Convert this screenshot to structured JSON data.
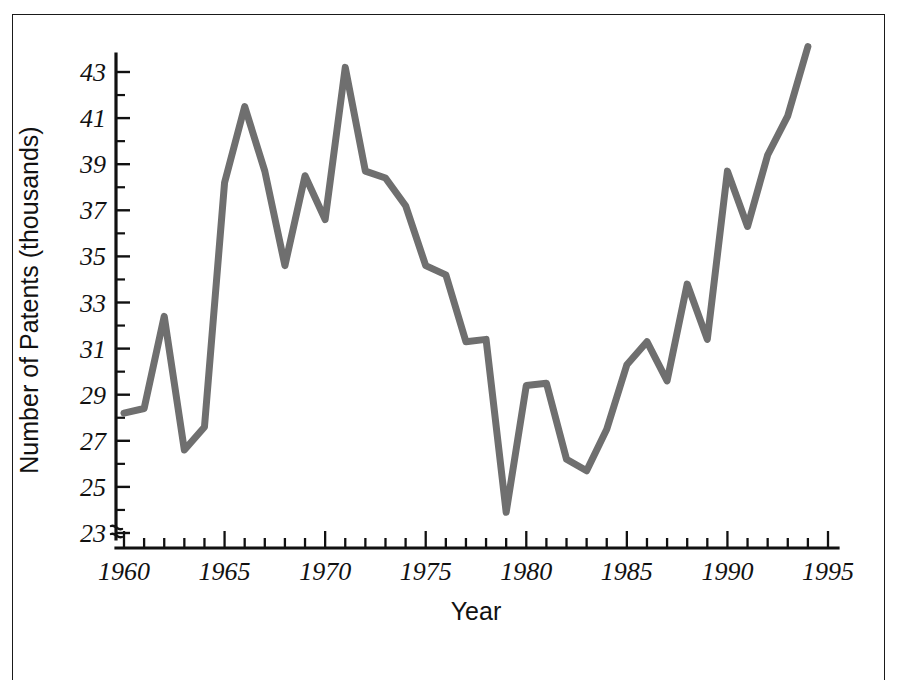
{
  "figure": {
    "line_color": "#6f6f6f",
    "axis_color": "#111111",
    "background": "#ffffff"
  },
  "axes": {
    "y_axis_label": "Number of Patents (thousands)",
    "x_axis_label": "Year",
    "y_tick_labels": [
      "23",
      "25",
      "27",
      "29",
      "31",
      "33",
      "35",
      "37",
      "39",
      "41",
      "43"
    ],
    "x_tick_labels": [
      "1960",
      "1965",
      "1970",
      "1975",
      "1980",
      "1985",
      "1990",
      "1995"
    ],
    "axis_break_symbol": "zigzag-break"
  },
  "chart_data": {
    "type": "line",
    "title": "",
    "xlabel": "Year",
    "ylabel": "Number of Patents (thousands)",
    "xlim": [
      1959.5,
      1995
    ],
    "ylim": [
      22.6,
      44.4
    ],
    "xticks": [
      1960,
      1965,
      1970,
      1975,
      1980,
      1985,
      1990,
      1995
    ],
    "yticks": [
      23,
      25,
      27,
      29,
      31,
      33,
      35,
      37,
      39,
      41,
      43
    ],
    "minor_ticks": true,
    "grid": false,
    "legend": null,
    "axis_break": "y-axis origin break below 23",
    "x": [
      1960,
      1961,
      1962,
      1963,
      1964,
      1965,
      1966,
      1967,
      1968,
      1969,
      1970,
      1971,
      1972,
      1973,
      1974,
      1975,
      1976,
      1977,
      1978,
      1979,
      1980,
      1981,
      1982,
      1983,
      1984,
      1985,
      1986,
      1987,
      1988,
      1989,
      1990,
      1991,
      1992,
      1993,
      1994
    ],
    "values": [
      28.2,
      28.4,
      32.4,
      26.6,
      27.6,
      38.2,
      41.5,
      38.7,
      34.6,
      38.5,
      36.6,
      43.2,
      38.7,
      38.4,
      37.2,
      34.6,
      34.2,
      31.3,
      31.4,
      23.9,
      29.4,
      29.5,
      26.2,
      25.7,
      27.5,
      30.3,
      31.3,
      29.6,
      33.8,
      31.4,
      38.7,
      36.3,
      39.4,
      41.1,
      44.1
    ],
    "series": [
      {
        "name": "Number of Patents",
        "values": [
          28.2,
          28.4,
          32.4,
          26.6,
          27.6,
          38.2,
          41.5,
          38.7,
          34.6,
          38.5,
          36.6,
          43.2,
          38.7,
          38.4,
          37.2,
          34.6,
          34.2,
          31.3,
          31.4,
          23.9,
          29.4,
          29.5,
          26.2,
          25.7,
          27.5,
          30.3,
          31.3,
          29.6,
          33.8,
          31.4,
          38.7,
          36.3,
          39.4,
          41.1,
          44.1
        ]
      }
    ]
  }
}
